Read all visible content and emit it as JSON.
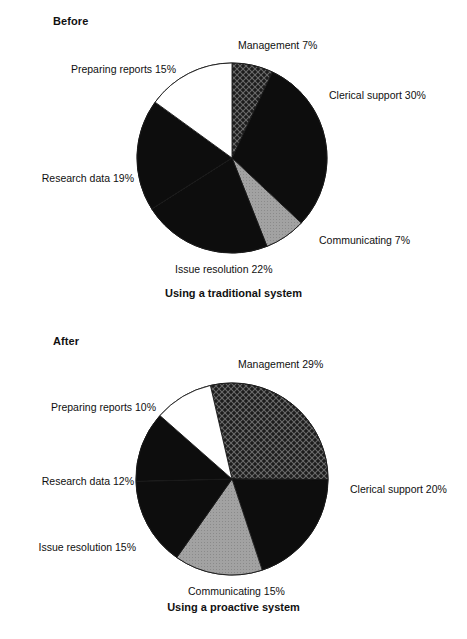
{
  "page": {
    "background": "#ffffff",
    "text_color": "#101010"
  },
  "panels": [
    {
      "id": "before",
      "heading": "Before",
      "caption": "Using a traditional system"
    },
    {
      "id": "after",
      "heading": "After",
      "caption": "Using a proactive system"
    }
  ],
  "chart_data": [
    {
      "type": "pie",
      "title": "Before",
      "subtitle": "Using a traditional system",
      "xlabel": "",
      "ylabel": "",
      "legend": "labels-outside",
      "grid": false,
      "total": 100,
      "units": "%",
      "categories": [
        "Management",
        "Clerical support",
        "Communicating",
        "Issue resolution",
        "Research data",
        "Preparing reports"
      ],
      "values": [
        7,
        30,
        7,
        22,
        19,
        15
      ],
      "labels": [
        "Management 7%",
        "Clerical support 30%",
        "Communicating 7%",
        "Issue resolution 22%",
        "Research data 19%",
        "Preparing reports 15%"
      ],
      "slice_fills": [
        "crosshatch",
        "black",
        "gray",
        "black",
        "black",
        "white"
      ],
      "slice_colors": [
        "#1a1a1a",
        "#0d0d0d",
        "#9b9b9b",
        "#0d0d0d",
        "#0d0d0d",
        "#ffffff"
      ]
    },
    {
      "type": "pie",
      "title": "After",
      "subtitle": "Using a proactive system",
      "xlabel": "",
      "ylabel": "",
      "legend": "labels-outside",
      "grid": false,
      "total": 101,
      "units": "%",
      "categories": [
        "Management",
        "Clerical support",
        "Communicating",
        "Issue resolution",
        "Research data",
        "Preparing reports"
      ],
      "values": [
        29,
        20,
        15,
        15,
        12,
        10
      ],
      "labels": [
        "Management 29%",
        "Clerical support 20%",
        "Communicating 15%",
        "Issue resolution 15%",
        "Research data 12%",
        "Preparing reports 10%"
      ],
      "slice_fills": [
        "crosshatch",
        "black",
        "gray",
        "black",
        "black",
        "white"
      ],
      "slice_colors": [
        "#1a1a1a",
        "#0d0d0d",
        "#9b9b9b",
        "#0d0d0d",
        "#0d0d0d",
        "#ffffff"
      ]
    }
  ],
  "chart_before": {
    "heading": "Before",
    "caption": "Using a traditional system",
    "labels": {
      "management": "Management 7%",
      "clerical": "Clerical support 30%",
      "communicating": "Communicating 7%",
      "issue": "Issue resolution 22%",
      "research": "Research data 19%",
      "reports": "Preparing reports 15%"
    }
  },
  "chart_after": {
    "heading": "After",
    "caption": "Using a proactive system",
    "labels": {
      "management": "Management 29%",
      "clerical": "Clerical support 20%",
      "communicating": "Communicating 15%",
      "issue": "Issue resolution 15%",
      "research": "Research data 12%",
      "reports": "Preparing reports 10%"
    }
  }
}
